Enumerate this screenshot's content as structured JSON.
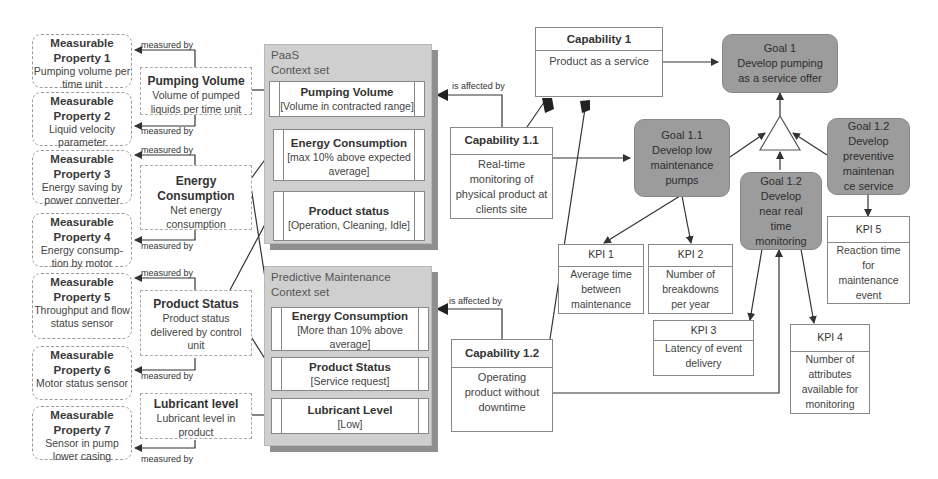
{
  "measurable_properties": [
    {
      "title": "Measurable Property 1",
      "desc": "Pumping volume per time unit"
    },
    {
      "title": "Measurable Property 2",
      "desc": "Liquid velocity parameter"
    },
    {
      "title": "Measurable Property 3",
      "desc": "Energy saving by power converter"
    },
    {
      "title": "Measurable Property 4",
      "desc": "Energy consump-tion by motor"
    },
    {
      "title": "Measurable Property 5",
      "desc": "Throughput and flow status sensor"
    },
    {
      "title": "Measurable Property 6",
      "desc": "Motor status sensor"
    },
    {
      "title": "Measurable Property 7",
      "desc": "Sensor in pump lower casing"
    }
  ],
  "measured_by_label": "measured by",
  "attributes": [
    {
      "title": "Pumping Volume",
      "desc": "Volume of pumped liquids per time unit"
    },
    {
      "title": "Energy Consumption",
      "desc": "Net energy consumption"
    },
    {
      "title": "Product Status",
      "desc": "Product status delivered by control unit"
    },
    {
      "title": "Lubricant level",
      "desc": "Lubricant level in product"
    }
  ],
  "context_sets": [
    {
      "title_line1": "PaaS",
      "title_line2": "Context set",
      "items": [
        {
          "title": "Pumping Volume",
          "value": "[Volume in contracted range]"
        },
        {
          "title": "Energy Consumption",
          "value": "[max 10% above expected average]"
        },
        {
          "title": "Product status",
          "value": "[Operation, Cleaning, Idle]"
        }
      ]
    },
    {
      "title_line1": "Predictive Maintenance",
      "title_line2": "Context set",
      "items": [
        {
          "title": "Energy Consumption",
          "value": "[More than 10%  above average]"
        },
        {
          "title": "Product Status",
          "value": "[Service request]"
        },
        {
          "title": "Lubricant Level",
          "value": "[Low]"
        }
      ]
    }
  ],
  "is_affected_by_label": "is affected by",
  "capabilities": [
    {
      "title": "Capability 1",
      "desc": "Product as a service"
    },
    {
      "title": "Capability 1.1",
      "desc": "Real-time monitoring of physical product at clients site"
    },
    {
      "title": "Capability 1.2",
      "desc": "Operating product without downtime"
    }
  ],
  "goals": [
    {
      "id": "Goal 1",
      "desc": "Develop pumping as a service offer"
    },
    {
      "id": "Goal 1.1",
      "desc": "Develop low maintenance pumps"
    },
    {
      "id": "Goal 1.2",
      "desc": "Develop near real time monitoring"
    },
    {
      "id": "Goal 1.2",
      "desc": "Develop preventive maintenan ce service"
    }
  ],
  "kpis": [
    {
      "title": "KPI 1",
      "desc": "Average time between maintenance"
    },
    {
      "title": "KPI 2",
      "desc": "Number of breakdowns per year"
    },
    {
      "title": "KPI 3",
      "desc": "Latency of event delivery"
    },
    {
      "title": "KPI 4",
      "desc": "Number of attributes available for monitoring"
    },
    {
      "title": "KPI 5",
      "desc": "Reaction time for maintenance event"
    }
  ],
  "colors": {
    "goal_fill": "#9c9c9c",
    "context_fill": "#cfcfcf",
    "line": "#333333"
  }
}
